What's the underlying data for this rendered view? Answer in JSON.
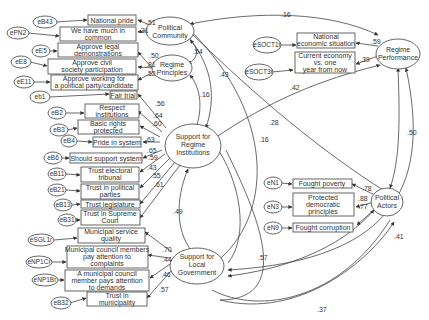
{
  "diagram": {
    "type": "structural equation model path diagram",
    "latent_factors": [
      {
        "id": "pc",
        "label_lines": [
          "Political",
          "Community"
        ]
      },
      {
        "id": "rp",
        "label_lines": [
          "Regime",
          "Principles"
        ]
      },
      {
        "id": "sri",
        "label_lines": [
          "Support for",
          "Regime",
          "Institutions"
        ]
      },
      {
        "id": "slg",
        "label_lines": [
          "Support for",
          "Local",
          "Government"
        ]
      },
      {
        "id": "rperf",
        "label_lines": [
          "Regime",
          "Performance"
        ]
      },
      {
        "id": "pa",
        "label_lines": [
          "Political",
          "Actors"
        ]
      }
    ],
    "indicators": [
      {
        "error": "eB43",
        "lines": [
          "National pride"
        ],
        "factor": "pc",
        "loading": ".51"
      },
      {
        "error": "ePN2",
        "lines": [
          "We have much in",
          "common"
        ],
        "factor": "pc",
        "loading": ".31"
      },
      {
        "error": "eE5",
        "lines": [
          "Approve legal",
          "demonstrations"
        ],
        "factor": "rp",
        "loading": ".50"
      },
      {
        "error": "eE8",
        "lines": [
          "Approve civil",
          "society participation"
        ],
        "factor": "rp",
        "loading": ".81"
      },
      {
        "error": "eE11",
        "lines": [
          "Approve working for",
          "a political party/candidate"
        ],
        "factor": "rp",
        "loading": ".52"
      },
      {
        "error": "eb1",
        "lines": [
          "Fair trial"
        ],
        "factor": "sri",
        "loading": ".56"
      },
      {
        "error": "eB2",
        "lines": [
          "Respect",
          "institutions"
        ],
        "factor": "sri",
        "loading": ".64"
      },
      {
        "error": "eB3",
        "lines": [
          "Basic rights",
          "protected"
        ],
        "factor": "sri",
        "loading": ".60"
      },
      {
        "error": "eB4",
        "lines": [
          "Pride in system"
        ],
        "factor": "sri",
        "loading": ".63"
      },
      {
        "error": "eB6",
        "lines": [
          "Should support system"
        ],
        "factor": "sri",
        "loading": ".65"
      },
      {
        "error": "eB11",
        "lines": [
          "Trust electoral",
          "tribunal"
        ],
        "factor": "sri",
        "loading": ".59"
      },
      {
        "error": "eB21",
        "lines": [
          "Trust in political",
          "parties"
        ],
        "factor": "sri",
        "loading": ".43"
      },
      {
        "error": "eB13",
        "lines": [
          "Trust legislature"
        ],
        "factor": "sri",
        "loading": ".55"
      },
      {
        "error": "eB31",
        "lines": [
          "Trust in Supreme",
          "Court"
        ],
        "factor": "sri",
        "loading": ".61"
      },
      {
        "error": "eSGL1r",
        "lines": [
          "Municipal service",
          "quality"
        ],
        "factor": "slg",
        "loading": ".70"
      },
      {
        "error": "eNP1Cr",
        "lines": [
          "Municipal council members",
          "pay attention to",
          "complaints"
        ],
        "factor": "slg",
        "loading": ".44"
      },
      {
        "error": "eNP1Br",
        "lines": [
          "A municipal council",
          "member pays attention",
          "to demands"
        ],
        "factor": "slg",
        "loading": ".46"
      },
      {
        "error": "eB32",
        "lines": [
          "Trust in",
          "municipality"
        ],
        "factor": "slg",
        "loading": ".57"
      },
      {
        "error": "eSOCT1r",
        "lines": [
          "National",
          "economic situation"
        ],
        "factor": "rperf",
        "loading": ".59"
      },
      {
        "error": "eSOCT3r",
        "lines": [
          "Current economy",
          "vs. one",
          "year from now"
        ],
        "factor": "rperf",
        "loading": ".39"
      },
      {
        "error": "eN1",
        "lines": [
          "Fought poverty"
        ],
        "factor": "pa",
        "loading": ".78"
      },
      {
        "error": "eN3",
        "lines": [
          "Protected",
          "democratic",
          "principles"
        ],
        "factor": "pa",
        "loading": ".88"
      },
      {
        "error": "eN9",
        "lines": [
          "Fought corruption"
        ],
        "factor": "pa",
        "loading": ".77"
      }
    ],
    "covariances": [
      {
        "from": "pc",
        "to": "rp",
        "value": ".54"
      },
      {
        "from": "pc",
        "to": "rperf",
        "value": ".16"
      },
      {
        "from": "pc",
        "to": "sri",
        "value": ".43"
      },
      {
        "from": "pc",
        "to": "pa",
        "value": ".28"
      },
      {
        "from": "pc",
        "to": "slg",
        "value": ".16"
      },
      {
        "from": "rp",
        "to": "sri",
        "value": ".16"
      },
      {
        "from": "sri",
        "to": "rperf",
        "value": ".42"
      },
      {
        "from": "sri",
        "to": "slg",
        "value": ".49"
      },
      {
        "from": "rperf",
        "to": "pa",
        "value": ".50"
      },
      {
        "from": "rperf",
        "to": "slg",
        "value": ".41"
      },
      {
        "from": "pa",
        "to": "slg",
        "value": ".57"
      },
      {
        "from": "sri",
        "to": "pa",
        "value": ".37"
      }
    ]
  },
  "labels": {
    "pc": [
      "Political",
      "Community"
    ],
    "rp": [
      "Regime",
      "Principles"
    ],
    "sri": [
      "Support for",
      "Regime",
      "Institutions"
    ],
    "slg": [
      "Support for",
      "Local",
      "Government"
    ],
    "rperf": [
      "Regime",
      "Performance"
    ],
    "pa": [
      "Political",
      "Actors"
    ],
    "boxes": {
      "b43": [
        "National pride"
      ],
      "pn2": [
        "We have much in",
        "common"
      ],
      "e5": [
        "Approve legal",
        "demonstrations"
      ],
      "e8": [
        "Approve civil",
        "society participation"
      ],
      "e11": [
        "Approve working for",
        "a political party/candidate"
      ],
      "b1": [
        "Fair trial"
      ],
      "b2": [
        "Respect",
        "institutions"
      ],
      "b3": [
        "Basic rights",
        "protected"
      ],
      "b4": [
        "Pride in system"
      ],
      "b6": [
        "Should support system"
      ],
      "b11": [
        "Trust electoral",
        "tribunal"
      ],
      "b21": [
        "Trust in political",
        "parties"
      ],
      "b13": [
        "Trust legislature"
      ],
      "b31": [
        "Trust in Supreme",
        "Court"
      ],
      "sgl1": [
        "Municipal service",
        "quality"
      ],
      "np1c": [
        "Municipal council members",
        "pay attention to",
        "complaints"
      ],
      "np1b": [
        "A municipal council",
        "member pays attention",
        "to demands"
      ],
      "b32": [
        "Trust in",
        "municipality"
      ],
      "soct1": [
        "National",
        "economic situation"
      ],
      "soct3": [
        "Current economy",
        "vs. one",
        "year from now"
      ],
      "n1": [
        "Fought poverty"
      ],
      "n3": [
        "Protected",
        "democratic",
        "principles"
      ],
      "n9": [
        "Fought corruption"
      ]
    },
    "errors": {
      "b43": "eB43",
      "pn2": "ePN2",
      "e5": "eE5",
      "e8": "eE8",
      "e11": "eE11",
      "b1": "eb1",
      "b2": "eB2",
      "b3": "eB3",
      "b4": "eB4",
      "b6": "eB6",
      "b11": "eB11",
      "b21": "eB21",
      "b13": "eB13",
      "b31": "eB31",
      "sgl1": "eSGL1r",
      "np1c": "eNP1Cr",
      "np1b": "eNP1Br",
      "b32": "eB32",
      "soct1": "eSOCT1r",
      "soct3": "eSOCT3r",
      "n1": "eN1",
      "n3": "eN3",
      "n9": "eN9"
    },
    "coef": {
      "b43": ".51",
      "pn2": ".31",
      "pc_rp": ".54",
      "e5": ".50",
      "e8": ".81",
      "e11": ".52",
      "pc_rperf": ".16",
      "pc_sri": ".43",
      "rp_sri": ".16",
      "pc_pa": ".28",
      "pc_slg": ".16",
      "b1": ".56",
      "b2": ".64",
      "b3": ".60",
      "b4": ".63",
      "b6": ".65",
      "b11": ".59",
      "b21": ".43",
      "b13": ".55",
      "b31": ".61",
      "sri_rperf": ".42",
      "sri_slg": ".49",
      "sgl1": ".70",
      "np1c": ".44",
      "np1b": ".46",
      "b32": ".57",
      "soct1": ".59",
      "soct3": ".39",
      "rperf_pa": ".50",
      "n1": ".78",
      "n3": ".88",
      "n9": ".77",
      "pa_slg": ".57",
      "rperf_slg": ".41",
      "sri_pa": ".37"
    }
  }
}
